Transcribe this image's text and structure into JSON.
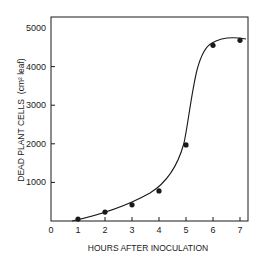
{
  "chart_data": {
    "type": "scatter",
    "title": "",
    "xlabel": "HOURS AFTER INOCULATION",
    "ylabel": "DEAD PLANT CELLS",
    "ylabel_unit": "(cm² leaf)",
    "xlim": [
      0,
      7.3
    ],
    "ylim": [
      0,
      5000
    ],
    "x_ticks": [
      0,
      1,
      2,
      3,
      4,
      5,
      6,
      7
    ],
    "y_ticks": [
      1000,
      2000,
      3000,
      4000,
      5000
    ],
    "grid": false,
    "legend": null,
    "series": [
      {
        "name": "Dead plant cells",
        "x": [
          1,
          2,
          3,
          4,
          5,
          6,
          7
        ],
        "values": [
          50,
          230,
          420,
          780,
          1970,
          4550,
          4680
        ],
        "marker": "filled-circle",
        "fit_curve": "sigmoidal smooth line"
      }
    ],
    "colors": {
      "ink": "#1a1a1a",
      "background": "#ffffff"
    }
  }
}
